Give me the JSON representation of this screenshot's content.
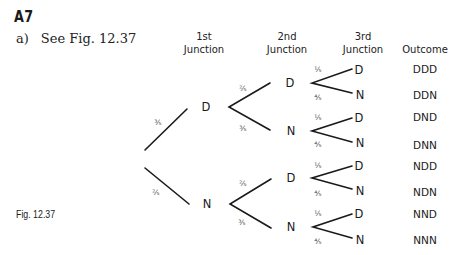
{
  "section": {
    "title": "A7"
  },
  "answer": {
    "part": "a)",
    "text": "See Fig. 12.37"
  },
  "figure": {
    "caption": "Fig. 12.37"
  },
  "headers": {
    "first": [
      "1st",
      "Junction"
    ],
    "second": [
      "2nd",
      "Junction"
    ],
    "third": [
      "3rd",
      "Junction"
    ],
    "outcome": "Outcome"
  },
  "tree": {
    "level1": [
      {
        "node": "D",
        "prob": "3/5"
      },
      {
        "node": "N",
        "prob": "2/5"
      }
    ],
    "level2": [
      {
        "node": "D",
        "prob": "2/5",
        "parent": "D"
      },
      {
        "node": "N",
        "prob": "3/5",
        "parent": "D"
      },
      {
        "node": "D",
        "prob": "2/5",
        "parent": "N"
      },
      {
        "node": "N",
        "prob": "3/5",
        "parent": "N"
      }
    ],
    "level3": [
      {
        "node": "D",
        "prob": "1/5",
        "outcome": "DDD"
      },
      {
        "node": "N",
        "prob": "4/5",
        "outcome": "DDN"
      },
      {
        "node": "D",
        "prob": "1/5",
        "outcome": "DND"
      },
      {
        "node": "N",
        "prob": "4/5",
        "outcome": "DNN"
      },
      {
        "node": "D",
        "prob": "1/5",
        "outcome": "NDD"
      },
      {
        "node": "N",
        "prob": "4/5",
        "outcome": "NDN"
      },
      {
        "node": "D",
        "prob": "1/5",
        "outcome": "NND"
      },
      {
        "node": "N",
        "prob": "4/5",
        "outcome": "NNN"
      }
    ]
  },
  "fractions": {
    "1/5": "⅕",
    "2/5": "⅖",
    "3/5": "⅗",
    "4/5": "⅘"
  }
}
